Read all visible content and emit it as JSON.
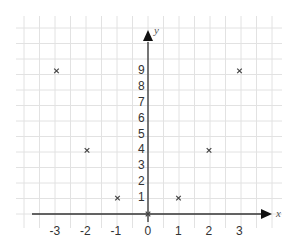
{
  "chart_data": {
    "type": "scatter",
    "title": "",
    "xlabel": "x",
    "ylabel": "y",
    "x_ticks": [
      "-3",
      "-2",
      "-1",
      "0",
      "1",
      "2",
      "3"
    ],
    "y_ticks": [
      "1",
      "2",
      "3",
      "4",
      "5",
      "6",
      "7",
      "8",
      "9"
    ],
    "xlim": [
      -3.5,
      3.9
    ],
    "ylim": [
      0,
      11.5
    ],
    "grid": true,
    "marker": "x",
    "series": [
      {
        "name": "points",
        "x": [
          -3,
          -2,
          -1,
          0,
          1,
          2,
          3
        ],
        "y": [
          9,
          4,
          1,
          0,
          1,
          4,
          9
        ]
      }
    ]
  },
  "colors": {
    "grid": "#e2e2e2",
    "axis": "#333333",
    "marker": "#444444",
    "text": "#333333"
  }
}
